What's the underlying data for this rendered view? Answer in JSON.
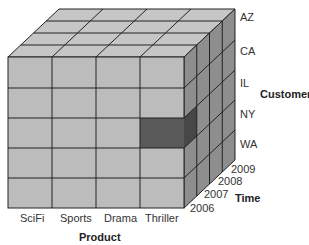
{
  "diagram": {
    "type": "olap-cube",
    "axes": {
      "product": {
        "title": "Product",
        "members": [
          "SciFi",
          "Sports",
          "Drama",
          "Thriller"
        ]
      },
      "customer": {
        "title": "Customer",
        "members": [
          "AZ",
          "CA",
          "IL",
          "NY",
          "WA"
        ]
      },
      "time": {
        "title": "Time",
        "members": [
          "2006",
          "2007",
          "2008",
          "2009"
        ]
      }
    },
    "highlighted_cell": {
      "product": "Thriller",
      "customer": "NY",
      "time": "2006"
    },
    "colors": {
      "face_front": "#bdbdbd",
      "face_top": "#c8c8c8",
      "face_side": "#8f8f8f",
      "highlight": "#5a5a5a",
      "highlight_side": "#4a4a4a",
      "grid": "#222222"
    }
  }
}
